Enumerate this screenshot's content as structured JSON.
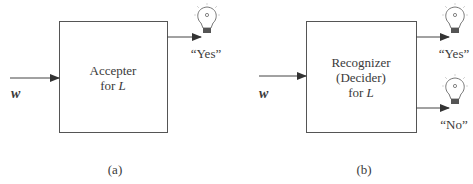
{
  "diagram_a": {
    "box_lines": [
      "Accepter",
      "for "
    ],
    "box_var": "L",
    "input_label": "w",
    "output_yes": "“Yes”",
    "caption": "(a)"
  },
  "diagram_b": {
    "box_lines": [
      "Recognizer",
      "(Decider)",
      "for "
    ],
    "box_var": "L",
    "input_label": "w",
    "output_yes": "“Yes”",
    "output_no": "“No”",
    "caption": "(b)"
  },
  "colors": {
    "stroke": "#555555",
    "text": "#3a3a3a"
  }
}
